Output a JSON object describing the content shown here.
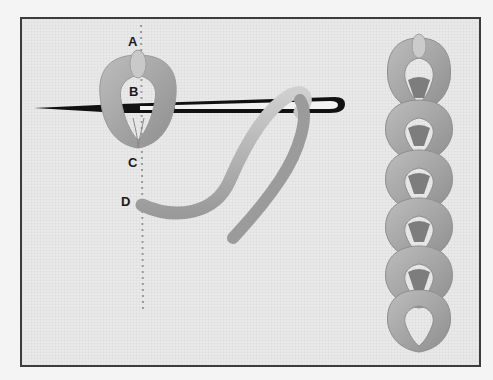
{
  "diagram": {
    "labels": {
      "a": "A",
      "b": "B",
      "c": "C",
      "d": "D"
    },
    "colors": {
      "background": "#e9e9e9",
      "border": "#3c3c3c",
      "thread": "#a8a8a8",
      "thread_dark": "#8c8c8c",
      "needle": "#111111",
      "guide_line": "#9a9a9a"
    },
    "parts": [
      "stitch-loop",
      "needle",
      "working-thread",
      "guide-line",
      "finished-chain"
    ]
  }
}
